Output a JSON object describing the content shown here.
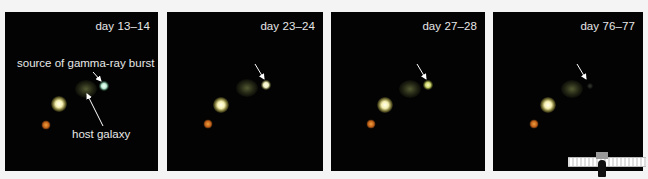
{
  "figure": {
    "panels": [
      {
        "label": "day 13–14",
        "grb_brightness": "bright"
      },
      {
        "label": "day 23–24",
        "grb_brightness": "bright"
      },
      {
        "label": "day 27–28",
        "grb_brightness": "moderate"
      },
      {
        "label": "day 76–77",
        "grb_brightness": "faded"
      }
    ],
    "annotations": {
      "source": "source of gamma-ray burst",
      "host": "host galaxy"
    },
    "colors": {
      "background": "#f4f4f4",
      "panel": "#030303",
      "text": "#e8e8e8"
    }
  }
}
